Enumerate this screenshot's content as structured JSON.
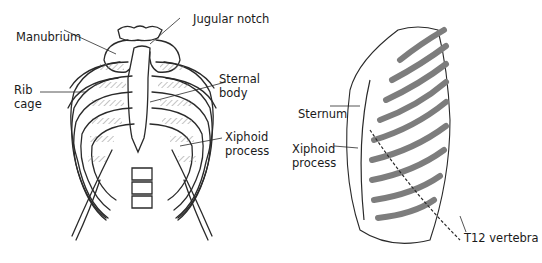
{
  "figure": {
    "panels": [
      {
        "id": "anterior-view",
        "labels": {
          "manubrium": "Manubrium",
          "jugular_notch": "Jugular notch",
          "rib_cage_1": "Rib",
          "rib_cage_2": "cage",
          "sternal_body_1": "Sternal",
          "sternal_body_2": "body",
          "xiphoid_1": "Xiphoid",
          "xiphoid_2": "process"
        }
      },
      {
        "id": "lateral-view",
        "labels": {
          "sternum": "Sternum",
          "xiphoid_1": "Xiphoid",
          "xiphoid_2": "process",
          "t12": "T12 vertebra"
        }
      }
    ],
    "colors": {
      "line": "#2a2a2a",
      "hatch": "#8a8a8a",
      "rib_shade": "#7d7d7d",
      "background": "#ffffff"
    }
  }
}
